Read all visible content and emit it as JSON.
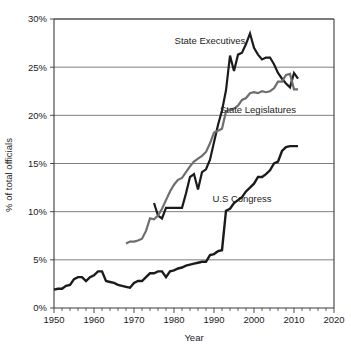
{
  "chart_data": {
    "type": "line",
    "title": "",
    "xlabel": "Year",
    "ylabel": "% of total officials",
    "xlim": [
      1950,
      2020
    ],
    "ylim": [
      0,
      30
    ],
    "grid": "horizontal",
    "legend": "inline-annotations",
    "x_ticks": [
      1950,
      1960,
      1970,
      1980,
      1990,
      2000,
      2010,
      2020
    ],
    "x_tick_labels": [
      "1950",
      "1960",
      "1970",
      "1980",
      "1990",
      "2000",
      "2010",
      "2020"
    ],
    "x_minor_tick_step": 2,
    "y_ticks": [
      0,
      5,
      10,
      15,
      20,
      25,
      30
    ],
    "y_tick_labels": [
      "0%",
      "5%",
      "10%",
      "15%",
      "20%",
      "25%",
      "30%"
    ],
    "series": [
      {
        "name": "State Executives",
        "color": "#1b1b1b",
        "stroke_width": 2.2,
        "label_x": 1989,
        "label_y": 27.8,
        "points": [
          [
            1975,
            10.9
          ],
          [
            1976,
            9.6
          ],
          [
            1977,
            9.3
          ],
          [
            1978,
            10.4
          ],
          [
            1979,
            10.4
          ],
          [
            1980,
            10.4
          ],
          [
            1981,
            10.4
          ],
          [
            1982,
            10.4
          ],
          [
            1983,
            11.9
          ],
          [
            1984,
            13.6
          ],
          [
            1985,
            13.9
          ],
          [
            1986,
            12.3
          ],
          [
            1987,
            14.1
          ],
          [
            1988,
            14.4
          ],
          [
            1989,
            15.4
          ],
          [
            1990,
            17.2
          ],
          [
            1991,
            19.0
          ],
          [
            1992,
            20.5
          ],
          [
            1993,
            22.6
          ],
          [
            1994,
            26.2
          ],
          [
            1995,
            24.6
          ],
          [
            1996,
            26.3
          ],
          [
            1997,
            26.5
          ],
          [
            1998,
            27.4
          ],
          [
            1999,
            28.5
          ],
          [
            2000,
            27.0
          ],
          [
            2001,
            26.3
          ],
          [
            2002,
            25.8
          ],
          [
            2003,
            26.0
          ],
          [
            2004,
            26.0
          ],
          [
            2005,
            25.3
          ],
          [
            2006,
            24.4
          ],
          [
            2007,
            23.8
          ],
          [
            2008,
            23.3
          ],
          [
            2009,
            22.9
          ],
          [
            2010,
            24.4
          ],
          [
            2011,
            23.8
          ]
        ]
      },
      {
        "name": "State Legislatures",
        "color": "#6e6e6e",
        "stroke_width": 2.2,
        "label_x": 2001,
        "label_y": 20.6,
        "points": [
          [
            1968,
            6.7
          ],
          [
            1969,
            6.9
          ],
          [
            1970,
            6.9
          ],
          [
            1971,
            7.0
          ],
          [
            1972,
            7.2
          ],
          [
            1973,
            8.0
          ],
          [
            1974,
            9.3
          ],
          [
            1975,
            9.2
          ],
          [
            1976,
            9.6
          ],
          [
            1977,
            10.3
          ],
          [
            1978,
            11.2
          ],
          [
            1979,
            12.1
          ],
          [
            1980,
            12.8
          ],
          [
            1981,
            13.3
          ],
          [
            1982,
            13.5
          ],
          [
            1983,
            14.1
          ],
          [
            1984,
            14.7
          ],
          [
            1985,
            15.2
          ],
          [
            1986,
            15.5
          ],
          [
            1987,
            15.8
          ],
          [
            1988,
            16.2
          ],
          [
            1989,
            17.1
          ],
          [
            1990,
            18.2
          ],
          [
            1991,
            18.4
          ],
          [
            1992,
            18.6
          ],
          [
            1993,
            20.4
          ],
          [
            1994,
            20.6
          ],
          [
            1995,
            20.7
          ],
          [
            1996,
            21.0
          ],
          [
            1997,
            21.6
          ],
          [
            1998,
            21.8
          ],
          [
            1999,
            22.3
          ],
          [
            2000,
            22.4
          ],
          [
            2001,
            22.3
          ],
          [
            2002,
            22.5
          ],
          [
            2003,
            22.4
          ],
          [
            2004,
            22.5
          ],
          [
            2005,
            22.8
          ],
          [
            2006,
            23.5
          ],
          [
            2007,
            23.5
          ],
          [
            2008,
            24.2
          ],
          [
            2009,
            24.3
          ],
          [
            2010,
            22.7
          ],
          [
            2011,
            22.7
          ]
        ]
      },
      {
        "name": "U.S Congress",
        "color": "#1b1b1b",
        "stroke_width": 2.4,
        "label_x": 1997,
        "label_y": 11.4,
        "points": [
          [
            1950,
            1.9
          ],
          [
            1951,
            2.0
          ],
          [
            1952,
            2.0
          ],
          [
            1953,
            2.3
          ],
          [
            1954,
            2.4
          ],
          [
            1955,
            3.0
          ],
          [
            1956,
            3.2
          ],
          [
            1957,
            3.2
          ],
          [
            1958,
            2.8
          ],
          [
            1959,
            3.2
          ],
          [
            1960,
            3.4
          ],
          [
            1961,
            3.8
          ],
          [
            1962,
            3.8
          ],
          [
            1963,
            2.8
          ],
          [
            1964,
            2.7
          ],
          [
            1965,
            2.6
          ],
          [
            1966,
            2.4
          ],
          [
            1967,
            2.3
          ],
          [
            1968,
            2.2
          ],
          [
            1969,
            2.1
          ],
          [
            1970,
            2.6
          ],
          [
            1971,
            2.8
          ],
          [
            1972,
            2.8
          ],
          [
            1973,
            3.2
          ],
          [
            1974,
            3.6
          ],
          [
            1975,
            3.6
          ],
          [
            1976,
            3.8
          ],
          [
            1977,
            3.8
          ],
          [
            1978,
            3.2
          ],
          [
            1979,
            3.8
          ],
          [
            1980,
            3.9
          ],
          [
            1981,
            4.1
          ],
          [
            1982,
            4.2
          ],
          [
            1983,
            4.4
          ],
          [
            1984,
            4.5
          ],
          [
            1985,
            4.6
          ],
          [
            1986,
            4.7
          ],
          [
            1987,
            4.8
          ],
          [
            1988,
            4.8
          ],
          [
            1989,
            5.5
          ],
          [
            1990,
            5.6
          ],
          [
            1991,
            5.9
          ],
          [
            1992,
            6.0
          ],
          [
            1993,
            10.1
          ],
          [
            1994,
            10.3
          ],
          [
            1995,
            10.9
          ],
          [
            1996,
            11.2
          ],
          [
            1997,
            11.5
          ],
          [
            1998,
            12.1
          ],
          [
            1999,
            12.5
          ],
          [
            2000,
            12.9
          ],
          [
            2001,
            13.6
          ],
          [
            2002,
            13.6
          ],
          [
            2003,
            13.9
          ],
          [
            2004,
            14.3
          ],
          [
            2005,
            15.0
          ],
          [
            2006,
            15.2
          ],
          [
            2007,
            16.3
          ],
          [
            2008,
            16.7
          ],
          [
            2009,
            16.8
          ],
          [
            2010,
            16.8
          ],
          [
            2011,
            16.8
          ]
        ]
      }
    ]
  }
}
